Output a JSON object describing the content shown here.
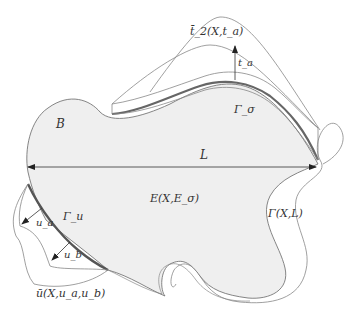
{
  "figure": {
    "labels": {
      "body": "B",
      "length": "L",
      "young_modulus": "E(X,E_σ)",
      "traction_boundary": "Γ_σ",
      "displacement_boundary": "Γ_u",
      "traction_magnitude": "t_a",
      "traction_function": "t̄_2(X,t_a)",
      "displacement_a": "u_a",
      "displacement_b": "u_b",
      "displacement_function": "ū(X,u_a,u_b)",
      "outer_boundary": "Γ(X,L)"
    },
    "colors": {
      "body_fill": "#efefef",
      "outline": "#777777",
      "boundary_highlight": "#666666",
      "text": "#333333"
    }
  }
}
